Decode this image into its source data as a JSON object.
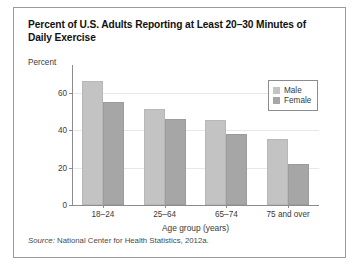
{
  "title": "Percent of U.S. Adults Reporting at Least 20–30 Minutes of Daily Exercise",
  "source": {
    "label": "Source:",
    "text": "National Center for Health Statistics, 2012a."
  },
  "legend": {
    "items": [
      {
        "label": "Male",
        "color": "#c3c3c3"
      },
      {
        "label": "Female",
        "color": "#a6a6a6"
      }
    ]
  },
  "chart_data": {
    "type": "bar",
    "title": "Percent of U.S. Adults Reporting at Least 20–30 Minutes of Daily Exercise",
    "categories": [
      "18–24",
      "25–64",
      "65–74",
      "75 and over"
    ],
    "series": [
      {
        "name": "Male",
        "color": "#c3c3c3",
        "values": [
          66,
          51,
          45.5,
          35
        ]
      },
      {
        "name": "Female",
        "color": "#a6a6a6",
        "values": [
          55,
          46,
          38,
          22
        ]
      }
    ],
    "xlabel": "Age group (years)",
    "ylabel": "Percent",
    "ylim": [
      0,
      72
    ],
    "yticks": [
      0,
      20,
      40,
      60
    ],
    "ytick_labels": [
      "0",
      "20",
      "40",
      "60"
    ],
    "grid": true,
    "legend_position": "top-right"
  }
}
